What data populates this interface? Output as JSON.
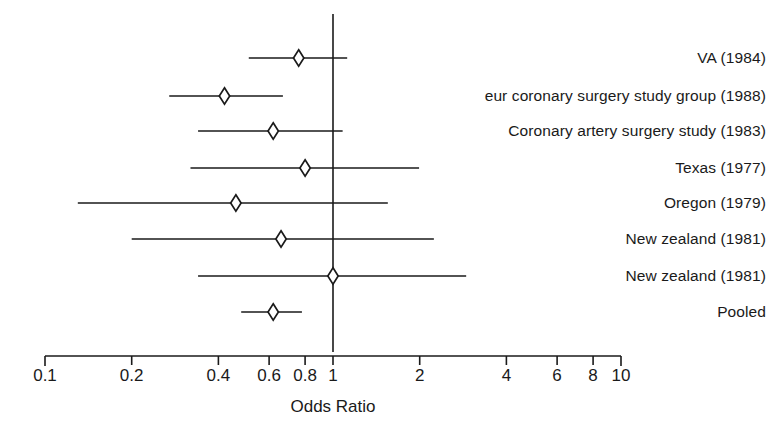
{
  "chart_data": {
    "type": "forest",
    "title": "",
    "xlabel": "Odds Ratio",
    "ylabel": "",
    "scale": "log",
    "xlim": [
      0.1,
      10
    ],
    "grid": false,
    "reference_line": 1,
    "tick_labels": [
      "0.1",
      "0.2",
      "0.4",
      "0.6",
      "0.8",
      "1",
      "2",
      "4",
      "6",
      "8",
      "10"
    ],
    "tick_values": [
      0.1,
      0.2,
      0.4,
      0.6,
      0.8,
      1,
      2,
      4,
      6,
      8,
      10
    ],
    "marker": "diamond",
    "categories": [
      "VA (1984)",
      "eur coronary surgery study group (1988)",
      "Coronary artery surgery study (1983)",
      "Texas (1977)",
      "Oregon (1979)",
      "New zealand (1981)",
      "New zealand (1981)",
      "Pooled"
    ],
    "rows": [
      {
        "label": "VA (1984)",
        "odds_ratio": 0.76,
        "ci_low": 0.51,
        "ci_high": 1.12
      },
      {
        "label": "eur coronary surgery study group (1988)",
        "odds_ratio": 0.42,
        "ci_low": 0.27,
        "ci_high": 0.67
      },
      {
        "label": "Coronary artery surgery study (1983)",
        "odds_ratio": 0.62,
        "ci_low": 0.34,
        "ci_high": 1.08
      },
      {
        "label": "Texas (1977)",
        "odds_ratio": 0.8,
        "ci_low": 0.32,
        "ci_high": 1.99
      },
      {
        "label": "Oregon (1979)",
        "odds_ratio": 0.46,
        "ci_low": 0.13,
        "ci_high": 1.55
      },
      {
        "label": "New zealand (1981)",
        "odds_ratio": 0.66,
        "ci_low": 0.2,
        "ci_high": 2.24
      },
      {
        "label": "New zealand (1981)",
        "odds_ratio": 1.0,
        "ci_low": 0.34,
        "ci_high": 2.9
      },
      {
        "label": "Pooled",
        "odds_ratio": 0.62,
        "ci_low": 0.48,
        "ci_high": 0.78
      }
    ],
    "colors": {
      "line": "#1a1a1a",
      "marker_fill": "#ffffff",
      "marker_stroke": "#1a1a1a",
      "axis": "#1a1a1a",
      "background": "#ffffff"
    }
  },
  "geometry": {
    "x_at_one": 333,
    "px_per_decade": 288,
    "axis_y": 356,
    "tick_len": 9,
    "row_y": [
      58,
      96,
      131,
      168,
      203,
      239,
      276,
      312
    ],
    "label_x_right": 766,
    "axis_title_x": 333,
    "axis_title_y": 397,
    "tick_label_y": 366
  }
}
